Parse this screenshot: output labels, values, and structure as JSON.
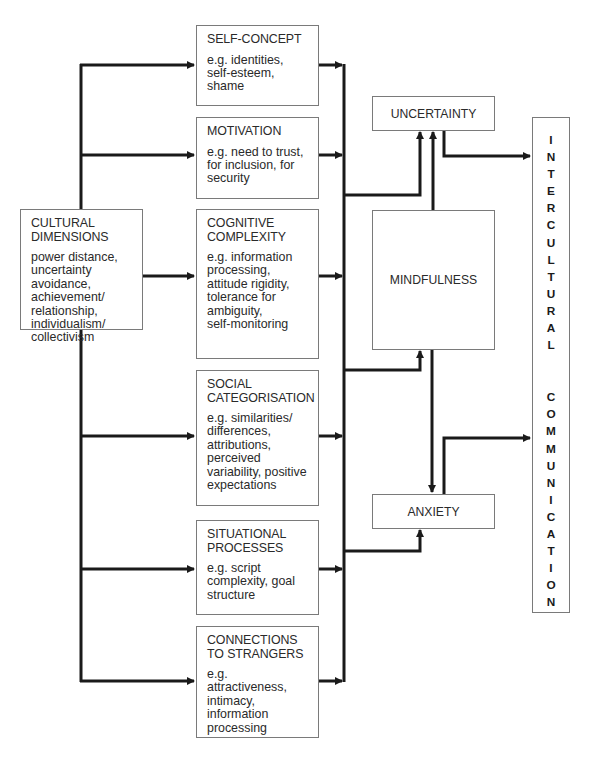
{
  "diagram": {
    "source": {
      "title": "CULTURAL\nDIMENSIONS",
      "description": "power distance,\nuncertainty\navoidance,\nachievement/\nrelationship,\nindividualism/\ncollectivism"
    },
    "factors": [
      {
        "title": "SELF-CONCEPT",
        "description": "e.g. identities,\nself-esteem,\nshame"
      },
      {
        "title": "MOTIVATION",
        "description": "e.g. need to trust,\nfor inclusion, for\nsecurity"
      },
      {
        "title": "COGNITIVE\nCOMPLEXITY",
        "description": "e.g. information\nprocessing,\nattitude rigidity,\ntolerance for\nambiguity,\nself-monitoring"
      },
      {
        "title": "SOCIAL\nCATEGORISATION",
        "description": "e.g. similarities/\ndifferences,\nattributions,\nperceived\nvariability, positive\nexpectations"
      },
      {
        "title": "SITUATIONAL\nPROCESSES",
        "description": "e.g. script\ncomplexity, goal\nstructure"
      },
      {
        "title": "CONNECTIONS\nTO STRANGERS",
        "description": "e.g. attractiveness,\nintimacy,\ninformation\nprocessing"
      }
    ],
    "mediators": {
      "uncertainty": "UNCERTAINTY",
      "mindfulness": "MINDFULNESS",
      "anxiety": "ANXIETY"
    },
    "outcome": {
      "word1": [
        "I",
        "N",
        "T",
        "E",
        "R",
        "C",
        "U",
        "L",
        "T",
        "U",
        "R",
        "A",
        "L"
      ],
      "word2": [
        "C",
        "O",
        "M",
        "M",
        "U",
        "N",
        "I",
        "C",
        "A",
        "T",
        "I",
        "O",
        "N"
      ]
    }
  },
  "colors": {
    "line": "#1a1a1a",
    "border": "#7a7a7a",
    "text": "#2a2a2a"
  }
}
